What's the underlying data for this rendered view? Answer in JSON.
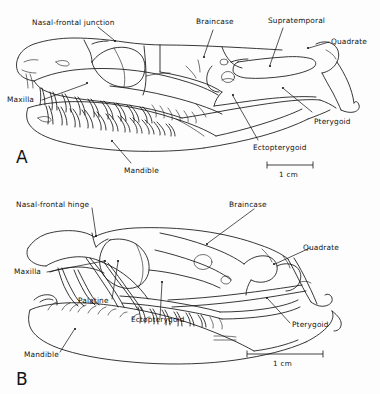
{
  "figure": {
    "type": "scientific-illustration",
    "background_color": "#fdfdfd",
    "ink_color": "#141414",
    "panels": [
      {
        "letter": "A",
        "labels": [
          {
            "id": "nasal-frontal-junction",
            "text": "Nasal-frontal junction"
          },
          {
            "id": "braincase",
            "text": "Braincase"
          },
          {
            "id": "supratemporal",
            "text": "Supratemporal"
          },
          {
            "id": "quadrate",
            "text": "Quadrate"
          },
          {
            "id": "maxilla",
            "text": "Maxilla"
          },
          {
            "id": "pterygoid",
            "text": "Pterygoid"
          },
          {
            "id": "ectopterygoid",
            "text": "Ectopterygoid"
          },
          {
            "id": "mandible",
            "text": "Mandible"
          }
        ],
        "scale_bar": {
          "label": "1 cm"
        }
      },
      {
        "letter": "B",
        "labels": [
          {
            "id": "nasal-frontal-hinge",
            "text": "Nasal-frontal  hinge"
          },
          {
            "id": "braincase",
            "text": "Braincase"
          },
          {
            "id": "quadrate",
            "text": "Quadrate"
          },
          {
            "id": "maxilla",
            "text": "Maxilla"
          },
          {
            "id": "palatine",
            "text": "Palatine"
          },
          {
            "id": "ectopterygoid",
            "text": "Ectopterygoid"
          },
          {
            "id": "pterygoid",
            "text": "Pterygoid"
          },
          {
            "id": "mandible",
            "text": "Mandible"
          }
        ],
        "scale_bar": {
          "label": "1 cm"
        }
      }
    ]
  }
}
